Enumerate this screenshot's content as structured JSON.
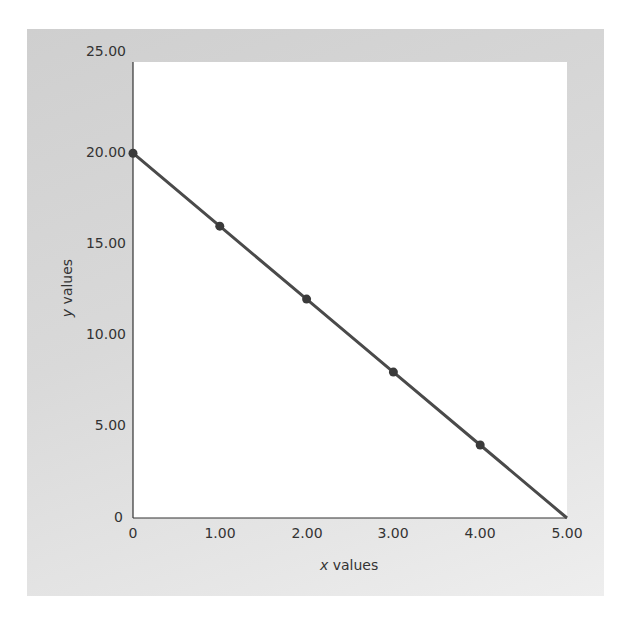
{
  "chart_data": {
    "type": "line",
    "title": "",
    "xlabel": "x values",
    "ylabel": "y values",
    "xlabel_var": "x",
    "xlabel_rest": " values",
    "ylabel_var": "y",
    "ylabel_rest": " values",
    "x": [
      0,
      1,
      2,
      3,
      4,
      5
    ],
    "series": [
      {
        "name": "y",
        "values": [
          20,
          16,
          12,
          8,
          4,
          0
        ],
        "markers": [
          true,
          true,
          true,
          true,
          true,
          false
        ]
      }
    ],
    "xlim": [
      0,
      5
    ],
    "ylim": [
      0,
      25
    ],
    "x_ticks": [
      "0",
      "1.00",
      "2.00",
      "3.00",
      "4.00",
      "5.00"
    ],
    "y_ticks": [
      "0",
      "5.00",
      "10.00",
      "15.00",
      "20.00",
      "25.00"
    ],
    "grid": false,
    "legend": null,
    "colors": {
      "line": "#4a4a4a",
      "marker": "#3a3a3a",
      "axis": "#333333",
      "panel": "#d6d6d6",
      "plot_bg": "#ffffff"
    }
  }
}
